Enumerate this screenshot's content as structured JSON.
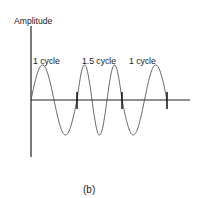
{
  "figure": {
    "caption": "(b)",
    "y_axis_label": "Amplitude",
    "segments": [
      {
        "label": "1 cycle",
        "cycles": 1,
        "x_start": 31,
        "x_end": 77
      },
      {
        "label": "1.5 cycle",
        "cycles": 1.5,
        "x_start": 77,
        "x_end": 122
      },
      {
        "label": "1 cycle",
        "cycles": 1,
        "x_start": 122,
        "x_end": 167
      }
    ],
    "tick_marks_x": [
      77,
      122,
      167
    ],
    "colors": {
      "wave": "#555555",
      "axis": "#222222",
      "tick": "#111111",
      "text": "#1a1a1a"
    }
  },
  "geometry": {
    "axis_origin": [
      31,
      100
    ],
    "y_axis_top": 26,
    "y_axis_bottom": 157,
    "x_axis_end": 190,
    "amplitude_px": 35
  }
}
